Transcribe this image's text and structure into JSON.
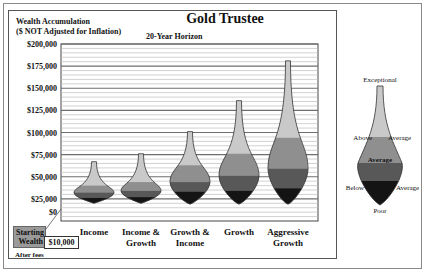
{
  "header": {
    "title": "Gold Trustee",
    "subtitle_line1": "Wealth Accumulation",
    "subtitle_line2": "($ NOT Adjusted for Inflation)",
    "horizon": "20-Year Horizon"
  },
  "starting_wealth": {
    "label_line1": "Starting",
    "label_line2": "Wealth",
    "value": "$10,000",
    "note": "After fees"
  },
  "colors": {
    "exceptional_to_above": "#c9c9c9",
    "above_to_average": "#8f8f8f",
    "average_to_below": "#585858",
    "below_to_poor": "#141414",
    "gridline_major": "#6e6e6e",
    "gridline_minor": "#bdbdbd"
  },
  "legend": {
    "top": "Exceptional",
    "above_left": "Above",
    "above_right": "Average",
    "middle": "Average",
    "below_left": "Below",
    "below_right": "Average",
    "bottom": "Poor"
  },
  "chart_data": {
    "type": "vase",
    "title": "Gold Trustee",
    "subtitle": "Wealth Accumulation ($ NOT Adjusted for Inflation) - 20-Year Horizon",
    "xlabel": "",
    "ylabel": "Wealth Accumulation ($)",
    "ylim": [
      0,
      200000
    ],
    "yticks": [
      0,
      25000,
      50000,
      75000,
      100000,
      125000,
      150000,
      175000,
      200000
    ],
    "ytick_labels": [
      "$0",
      "$25,000",
      "$50,000",
      "$75,000",
      "$100,000",
      "$125,000",
      "$150,000",
      "$175,000",
      "$200,000"
    ],
    "grid": true,
    "categories": [
      [
        "Income"
      ],
      [
        "Income &",
        "Growth"
      ],
      [
        "Growth &",
        "Income"
      ],
      [
        "Growth"
      ],
      [
        "Aggressive",
        "Growth"
      ]
    ],
    "series": [
      {
        "name": "Exceptional",
        "values": [
          67000,
          76000,
          101000,
          136000,
          181000
        ]
      },
      {
        "name": "Above Average",
        "values": [
          40000,
          44000,
          63000,
          76000,
          94000
        ]
      },
      {
        "name": "Average",
        "values": [
          32000,
          34000,
          44000,
          51000,
          59000
        ]
      },
      {
        "name": "Below Average",
        "values": [
          26000,
          27000,
          33000,
          34000,
          37000
        ]
      },
      {
        "name": "Poor",
        "values": [
          20000,
          20000,
          19000,
          19000,
          19000
        ]
      }
    ],
    "legend_position": "right"
  }
}
